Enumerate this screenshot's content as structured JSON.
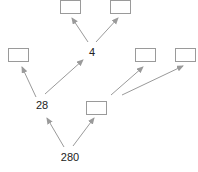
{
  "diagram": {
    "type": "factor-tree",
    "colors": {
      "edge": "#9a9a9a",
      "box_border": "#9a9a9a",
      "text": "#222222"
    },
    "nodes": [
      {
        "id": "n280",
        "kind": "number",
        "value": "280",
        "cx": 70,
        "cy": 157
      },
      {
        "id": "n28",
        "kind": "number",
        "value": "28",
        "cx": 42,
        "cy": 105
      },
      {
        "id": "nbox_mid",
        "kind": "blank-box",
        "x": 86,
        "y": 101,
        "w": 21,
        "h": 14
      },
      {
        "id": "nbox_left",
        "kind": "blank-box",
        "x": 8,
        "y": 48,
        "w": 21,
        "h": 14
      },
      {
        "id": "n4",
        "kind": "number",
        "value": "4",
        "cx": 92,
        "cy": 52
      },
      {
        "id": "nbox_r1",
        "kind": "blank-box",
        "x": 135,
        "y": 48,
        "w": 21,
        "h": 14
      },
      {
        "id": "nbox_r2",
        "kind": "blank-box",
        "x": 175,
        "y": 48,
        "w": 21,
        "h": 14
      },
      {
        "id": "nbox_tl",
        "kind": "blank-box",
        "x": 60,
        "y": 0,
        "w": 21,
        "h": 14
      },
      {
        "id": "nbox_tr",
        "kind": "blank-box",
        "x": 110,
        "y": 0,
        "w": 21,
        "h": 14
      }
    ],
    "edges": [
      {
        "from": "n280",
        "to": "n28",
        "x1": 64,
        "y1": 147,
        "x2": 47,
        "y2": 118
      },
      {
        "from": "n280",
        "to": "nbox_mid",
        "x1": 73,
        "y1": 146,
        "x2": 94,
        "y2": 118
      },
      {
        "from": "n28",
        "to": "nbox_left",
        "x1": 36,
        "y1": 97,
        "x2": 22,
        "y2": 67
      },
      {
        "from": "n28",
        "to": "n4",
        "x1": 45,
        "y1": 94,
        "x2": 83,
        "y2": 60
      },
      {
        "from": "nbox_mid",
        "to": "nbox_r1",
        "x1": 111,
        "y1": 95,
        "x2": 143,
        "y2": 67
      },
      {
        "from": "nbox_mid",
        "to": "nbox_r2",
        "x1": 122,
        "y1": 95,
        "x2": 183,
        "y2": 66
      },
      {
        "from": "n4",
        "to": "nbox_tl",
        "x1": 88,
        "y1": 42,
        "x2": 72,
        "y2": 18
      },
      {
        "from": "n4",
        "to": "nbox_tr",
        "x1": 96,
        "y1": 42,
        "x2": 118,
        "y2": 18
      }
    ]
  }
}
